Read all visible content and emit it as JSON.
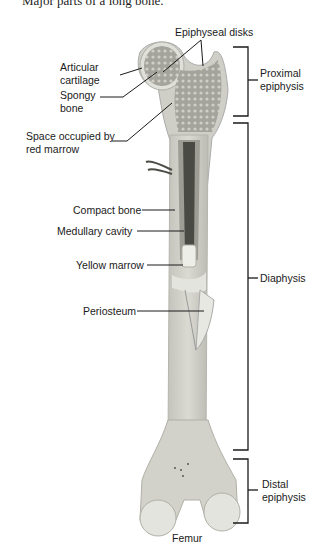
{
  "caption": "Major parts of a long bone.",
  "labels": {
    "epiphyseal_disks": "Epiphyseal disks",
    "articular_cartilage_1": "Articular",
    "articular_cartilage_2": "cartilage",
    "spongy_bone_1": "Spongy",
    "spongy_bone_2": "bone",
    "red_marrow_1": "Space occupied by",
    "red_marrow_2": "red marrow",
    "compact_bone": "Compact bone",
    "medullary_cavity": "Medullary cavity",
    "yellow_marrow": "Yellow marrow",
    "periosteum": "Periosteum",
    "femur": "Femur"
  },
  "regions": {
    "proximal_1": "Proximal",
    "proximal_2": "epiphysis",
    "diaphysis": "Diaphysis",
    "distal_1": "Distal",
    "distal_2": "epiphysis"
  },
  "colors": {
    "bone": "#d6d6d0",
    "bone_edge": "#b5b5ae",
    "spongy": "#8f8f88",
    "cavity": "#4a4a44",
    "cartilage": "#e4e4de",
    "line": "#1a1a1a"
  }
}
